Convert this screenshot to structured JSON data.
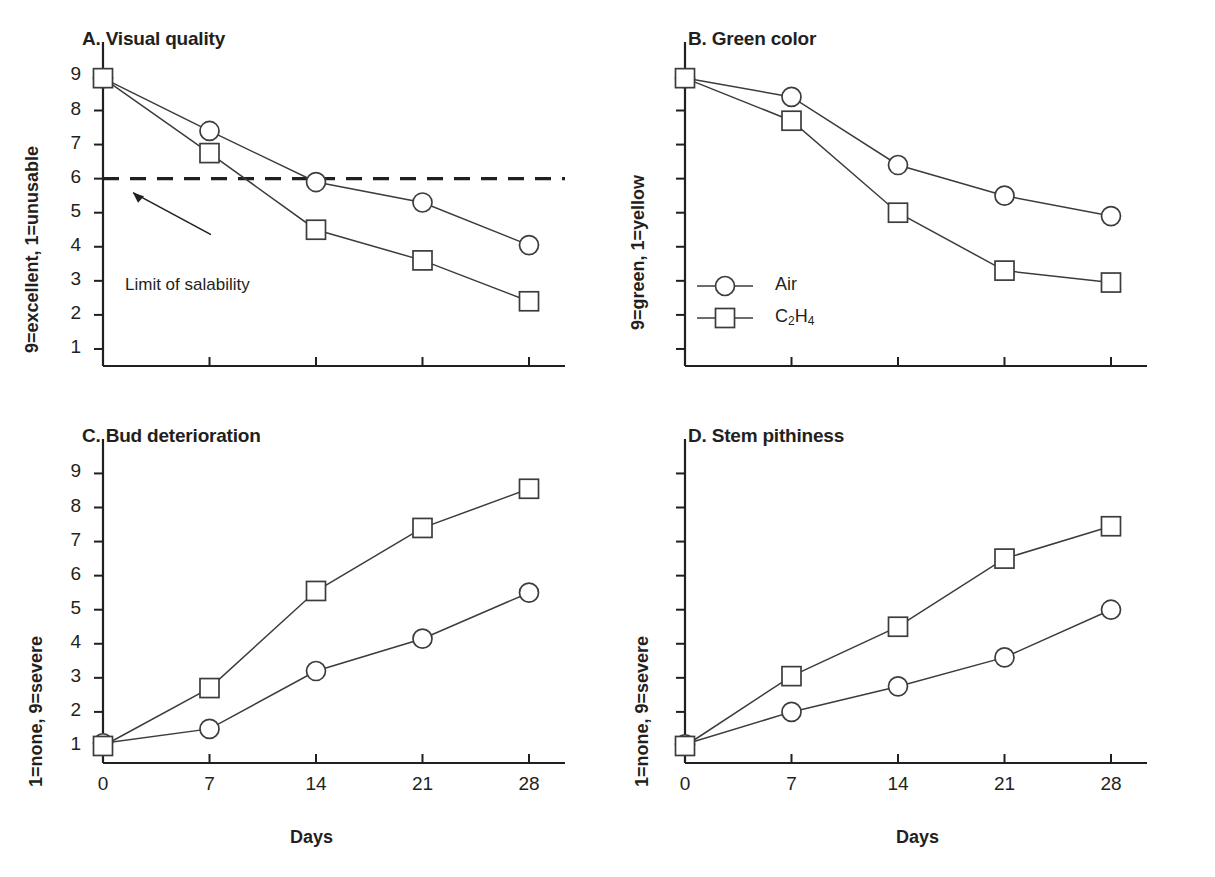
{
  "figure": {
    "background": "#ffffff",
    "ink": "#231f20",
    "line_color": "#3c3c3c",
    "marker_fill": "#ffffff",
    "topstrip_text": ""
  },
  "legend": {
    "position": "panel-B-lower-left",
    "entries": [
      {
        "label": "Air",
        "marker": "circle-open-marker"
      },
      {
        "label": "C2H4",
        "label_html": "C<sub>2</sub>H<sub>4</sub>",
        "marker": "square-open-marker"
      }
    ]
  },
  "axis": {
    "x_categories": [
      0,
      7,
      14,
      21,
      28
    ],
    "x_tick_labels": [
      "0",
      "7",
      "14",
      "21",
      "28"
    ],
    "x_title": "Days",
    "y_tick_values": [
      1,
      2,
      3,
      4,
      5,
      6,
      7,
      8,
      9
    ],
    "y_tick_labels": [
      "1",
      "2",
      "3",
      "4",
      "5",
      "6",
      "7",
      "8",
      "9"
    ],
    "ylim": [
      0.5,
      9.6
    ]
  },
  "chart_data": [
    {
      "id": "panel-a",
      "type": "line",
      "title": "A. Visual quality",
      "xlabel": "",
      "ylabel": "9=excellent, 1=unusable",
      "x": [
        0,
        7,
        14,
        21,
        28
      ],
      "xticklabels_shown": false,
      "yticklabels_shown": true,
      "ylim": [
        0.5,
        9.6
      ],
      "grid": false,
      "legend": false,
      "series": [
        {
          "name": "Air",
          "marker": "circle",
          "values": [
            8.95,
            7.4,
            5.9,
            5.3,
            4.05
          ]
        },
        {
          "name": "C2H4",
          "marker": "square",
          "values": [
            8.95,
            6.75,
            4.5,
            3.6,
            2.4
          ]
        }
      ],
      "annotations": [
        {
          "text": "Limit of salability",
          "type": "arrow-label"
        }
      ],
      "reference_line": {
        "value": 6,
        "style": "dashed",
        "label": "Limit of salability"
      }
    },
    {
      "id": "panel-b",
      "type": "line",
      "title": "B. Green color",
      "xlabel": "",
      "ylabel": "9=green, 1=yellow",
      "x": [
        0,
        7,
        14,
        21,
        28
      ],
      "xticklabels_shown": false,
      "yticklabels_shown": false,
      "ylim": [
        0.5,
        9.6
      ],
      "grid": false,
      "legend": true,
      "series": [
        {
          "name": "Air",
          "marker": "circle",
          "values": [
            8.95,
            8.4,
            6.4,
            5.5,
            4.9
          ]
        },
        {
          "name": "C2H4",
          "marker": "square",
          "values": [
            8.95,
            7.7,
            5.0,
            3.3,
            2.95
          ]
        }
      ],
      "annotations": []
    },
    {
      "id": "panel-c",
      "type": "line",
      "title": "C. Bud deterioration",
      "xlabel": "Days",
      "ylabel": "1=none, 9=severe",
      "x": [
        0,
        7,
        14,
        21,
        28
      ],
      "xticklabels_shown": true,
      "yticklabels_shown": true,
      "ylim": [
        0.5,
        9.6
      ],
      "grid": false,
      "legend": false,
      "series": [
        {
          "name": "Air",
          "marker": "circle",
          "values": [
            1.08,
            1.5,
            3.2,
            4.15,
            5.5
          ]
        },
        {
          "name": "C2H4",
          "marker": "square",
          "values": [
            1.0,
            2.7,
            5.55,
            7.4,
            8.55
          ]
        }
      ],
      "annotations": []
    },
    {
      "id": "panel-d",
      "type": "line",
      "title": "D. Stem pithiness",
      "xlabel": "Days",
      "ylabel": "1=none, 9=severe",
      "x": [
        0,
        7,
        14,
        21,
        28
      ],
      "xticklabels_shown": false,
      "yticklabels_shown": false,
      "ylim": [
        0.5,
        9.6
      ],
      "grid": false,
      "legend": false,
      "series": [
        {
          "name": "Air",
          "marker": "circle",
          "values": [
            1.05,
            2.0,
            2.75,
            3.6,
            5.0
          ]
        },
        {
          "name": "C2H4",
          "marker": "square",
          "values": [
            1.0,
            3.05,
            4.5,
            6.5,
            7.45
          ]
        }
      ],
      "annotations": []
    }
  ]
}
